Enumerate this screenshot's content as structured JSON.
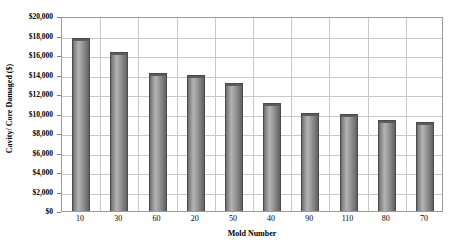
{
  "chart_data": {
    "type": "bar",
    "title": "",
    "xlabel": "Mold Number",
    "ylabel": "Cavity/ Core Damaged ($)",
    "categories": [
      "10",
      "30",
      "60",
      "20",
      "50",
      "40",
      "90",
      "110",
      "80",
      "70"
    ],
    "values": [
      17750,
      16350,
      14200,
      14000,
      13150,
      11100,
      10050,
      9950,
      9300,
      9150
    ],
    "ylim": [
      0,
      20000
    ],
    "ytick_step": 2000,
    "ytick_labels": [
      "$20,000",
      "$18,000",
      "$16,000",
      "$14,000",
      "$12,000",
      "$10,000",
      "$8,000",
      "$6,000",
      "$4,000",
      "$2,000",
      "$0"
    ],
    "ytick_values": [
      20000,
      18000,
      16000,
      14000,
      12000,
      10000,
      8000,
      6000,
      4000,
      2000,
      0
    ],
    "grid": {
      "horizontal": true,
      "vertical": true
    },
    "legend": {
      "visible": false,
      "position": "none"
    },
    "series": [
      {
        "name": "Cavity/ Core Damaged ($)",
        "values": [
          17750,
          16350,
          14200,
          14000,
          13150,
          11100,
          10050,
          9950,
          9300,
          9150
        ]
      }
    ],
    "colors": {
      "bar_fill_light": "#b3b3b3",
      "bar_fill_dark": "#616161",
      "bar_outline": "#4a4a4a",
      "gridline": "#c8c8c8",
      "axis": "#9a9a9a",
      "background": "#ffffff",
      "text": "#000000"
    }
  }
}
